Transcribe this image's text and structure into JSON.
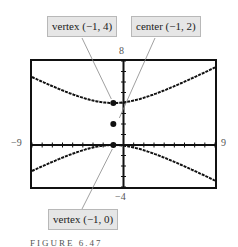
{
  "chart_data": {
    "type": "line",
    "title": "",
    "xlabel": "",
    "ylabel": "",
    "xlim": [
      -9,
      9
    ],
    "ylim": [
      -4,
      8
    ],
    "grid": false,
    "axis_tick_labels": {
      "xmin": "−9",
      "xmax": "9",
      "ymin": "−4",
      "ymax": "8"
    },
    "series": [
      {
        "name": "upper branch",
        "equation": "(y-2)^2/4 - (x+1)^2/16 = 1",
        "vertex": [
          -1,
          4
        ],
        "x": [
          -9,
          -7,
          -5,
          -3,
          -1,
          1,
          3,
          5,
          7
        ],
        "y": [
          6.47,
          5.61,
          4.83,
          4.24,
          4.0,
          4.24,
          4.83,
          5.61,
          6.47
        ]
      },
      {
        "name": "lower branch",
        "equation": "(y-2)^2/4 - (x+1)^2/16 = 1",
        "vertex": [
          -1,
          0
        ],
        "x": [
          -9,
          -7,
          -5,
          -3,
          -1,
          1,
          3,
          5,
          7
        ],
        "y": [
          -2.47,
          -1.61,
          -0.83,
          -0.24,
          0.0,
          -0.24,
          -0.83,
          -1.61,
          -2.47
        ]
      }
    ],
    "points": [
      {
        "label": "vertex (−1, 4)",
        "x": -1,
        "y": 4
      },
      {
        "label": "center (−1, 2)",
        "x": -1,
        "y": 2
      },
      {
        "label": "vertex (−1, 0)",
        "x": -1,
        "y": 0
      }
    ],
    "annotations": [
      "vertex (−1, 4)",
      "center (−1, 2)",
      "vertex (−1, 0)"
    ],
    "caption": "FIGURE 6.47"
  },
  "labels": {
    "vertex_top": "vertex (−1, 4)",
    "center": "center (−1, 2)",
    "vertex_bottom": "vertex (−1, 0)"
  },
  "ticks": {
    "ymax": "8",
    "ymin": "−4",
    "xmin": "−9",
    "xmax": "9"
  },
  "caption": "FIGURE 6.47"
}
